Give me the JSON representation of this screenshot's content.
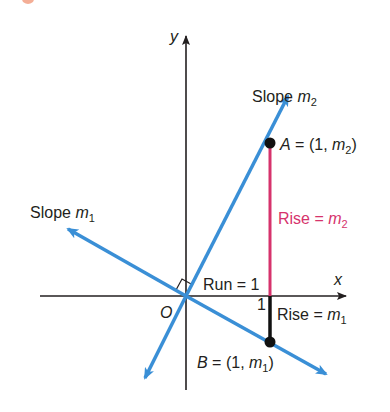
{
  "diagram": {
    "type": "coordinate-geometry",
    "axes": {
      "x_label": "x",
      "y_label": "y",
      "origin_label": "O",
      "tick_label": "1"
    },
    "lines": [
      {
        "name": "line-m2",
        "label_prefix": "Slope ",
        "label_var": "m",
        "label_sub": "2",
        "color": "#3a8fd6"
      },
      {
        "name": "line-m1",
        "label_prefix": "Slope ",
        "label_var": "m",
        "label_sub": "1",
        "color": "#3a8fd6"
      }
    ],
    "points": [
      {
        "name": "A",
        "text_prefix": "A",
        "text_mid": " = (1, ",
        "text_var": "m",
        "text_sub": "2",
        "text_close": ")"
      },
      {
        "name": "B",
        "text_prefix": "B",
        "text_mid": " = (1, ",
        "text_var": "m",
        "text_sub": "1",
        "text_close": ")"
      }
    ],
    "annotations": {
      "run": "Run = 1",
      "rise_m2_prefix": "Rise = ",
      "rise_m2_var": "m",
      "rise_m2_sub": "2",
      "rise_m1_prefix": "Rise = ",
      "rise_m1_var": "m",
      "rise_m1_sub": "1"
    },
    "colors": {
      "line": "#3a8fd6",
      "rise_m2": "#d6336c",
      "rise_m1": "#111111",
      "axis": "#231f20"
    }
  }
}
